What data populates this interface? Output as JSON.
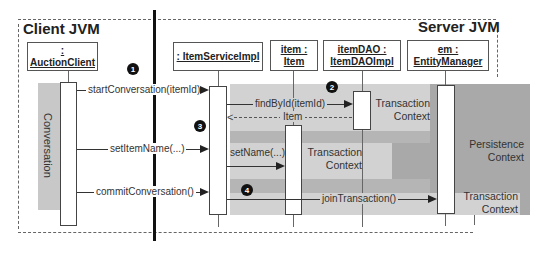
{
  "diagram": {
    "client_title": "Client JVM",
    "server_title": "Server JVM",
    "participants": [
      {
        "label": ": AuctionClient"
      },
      {
        "label": ": ItemServiceImpl"
      },
      {
        "label": "item :\nItem",
        "line1": "item :",
        "line2": "Item"
      },
      {
        "label": "itemDAO :\nItemDAOImpl",
        "line1": "itemDAO :",
        "line2": "ItemDAOImpl"
      },
      {
        "label": "em :\nEntityManager",
        "line1": "em :",
        "line2": "EntityManager"
      }
    ],
    "conversation_label": "Conversation",
    "messages": [
      {
        "label": "startConversation(itemId)",
        "from": "AuctionClient",
        "to": "ItemServiceImpl",
        "type": "sync"
      },
      {
        "label": "findById(itemId)",
        "from": "ItemServiceImpl",
        "to": "itemDAO",
        "type": "sync"
      },
      {
        "label": "Item",
        "from": "itemDAO",
        "to": "ItemServiceImpl",
        "type": "return"
      },
      {
        "label": "setItemName(...)",
        "from": "AuctionClient",
        "to": "ItemServiceImpl",
        "type": "sync"
      },
      {
        "label": "setName(...)",
        "from": "ItemServiceImpl",
        "to": "item",
        "type": "sync"
      },
      {
        "label": "commitConversation()",
        "from": "AuctionClient",
        "to": "ItemServiceImpl",
        "type": "sync"
      },
      {
        "label": "joinTransaction()",
        "from": "ItemServiceImpl",
        "to": "em",
        "type": "sync"
      }
    ],
    "contexts": {
      "tx1": {
        "line1": "Transaction",
        "line2": "Context"
      },
      "tx2": {
        "line1": "Transaction",
        "line2": "Context"
      },
      "tx3": {
        "line1": "Transaction",
        "line2": "Context"
      },
      "persistence": {
        "line1": "Persistence",
        "line2": "Context"
      }
    },
    "badges": [
      "1",
      "2",
      "3",
      "4"
    ],
    "colors": {
      "conversation_bar": "#c8c8c8",
      "persistence_context": "#a8a8a8",
      "transaction_context": "#d4d4d4",
      "mid_band": "#b4b4b4"
    }
  }
}
